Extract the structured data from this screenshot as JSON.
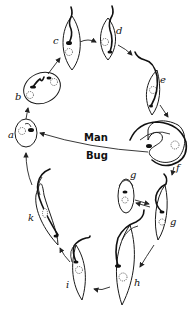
{
  "diagram": {
    "type": "life-cycle",
    "hosts": {
      "upper": "Man",
      "lower": "Bug"
    },
    "stage_labels": [
      "a",
      "b",
      "c",
      "d",
      "e",
      "f",
      "g",
      "g",
      "h",
      "i",
      "k"
    ],
    "stages": [
      {
        "id": "a",
        "label": "a",
        "form": "rounded amastigote"
      },
      {
        "id": "b",
        "label": "b",
        "form": "oval form with short flagellum"
      },
      {
        "id": "c",
        "label": "c",
        "form": "elongated form with flagellum"
      },
      {
        "id": "d",
        "label": "d",
        "form": "elongated form with flagellum"
      },
      {
        "id": "e",
        "label": "e",
        "form": "slender flagellated form"
      },
      {
        "id": "f",
        "label": "f",
        "form": "curled trypomastigote"
      },
      {
        "id": "g1",
        "label": "g",
        "form": "oval form"
      },
      {
        "id": "g2",
        "label": "g",
        "form": "flagellated form"
      },
      {
        "id": "h",
        "label": "h",
        "form": "long slender flagellate"
      },
      {
        "id": "i",
        "label": "i",
        "form": "long slender flagellate"
      },
      {
        "id": "k",
        "label": "k",
        "form": "slender undulating flagellate"
      }
    ],
    "flow": [
      "a",
      "b",
      "c",
      "d",
      "e",
      "f",
      "g",
      "h",
      "i",
      "k",
      "a"
    ],
    "colors": {
      "ink": "#111111",
      "background": "#ffffff"
    }
  }
}
